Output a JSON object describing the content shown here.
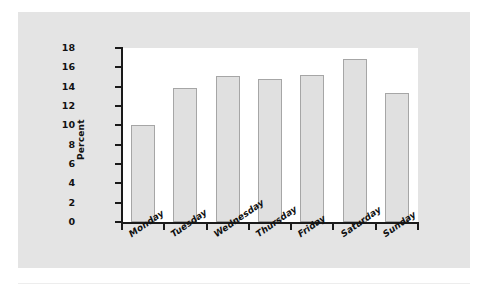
{
  "chart_data": {
    "type": "bar",
    "title": "",
    "subtitle": "",
    "xlabel": "",
    "ylabel": "Percent",
    "categories": [
      "Monday",
      "Tuesday",
      "Wednesday",
      "Thursday",
      "Friday",
      "Saturday",
      "Sunday"
    ],
    "values": [
      10.0,
      13.9,
      15.1,
      14.8,
      15.2,
      16.9,
      13.3
    ],
    "ylim": [
      0,
      18
    ],
    "ytick_step": 2,
    "ytick_labels": [
      "18",
      "16",
      "14",
      "12",
      "10",
      "8",
      "6",
      "4",
      "2",
      "0"
    ],
    "grid": false,
    "legend": null,
    "legend_position": "none",
    "annotations": []
  },
  "style": {
    "figure_background": "#e4e4e4",
    "plot_background": "#ffffff",
    "bar_fill": "#e0e0e0",
    "bar_border": "#a6a6a6",
    "axis_color": "#1a1a1a",
    "text_color": "#111111",
    "rule_color": "#ededed"
  }
}
